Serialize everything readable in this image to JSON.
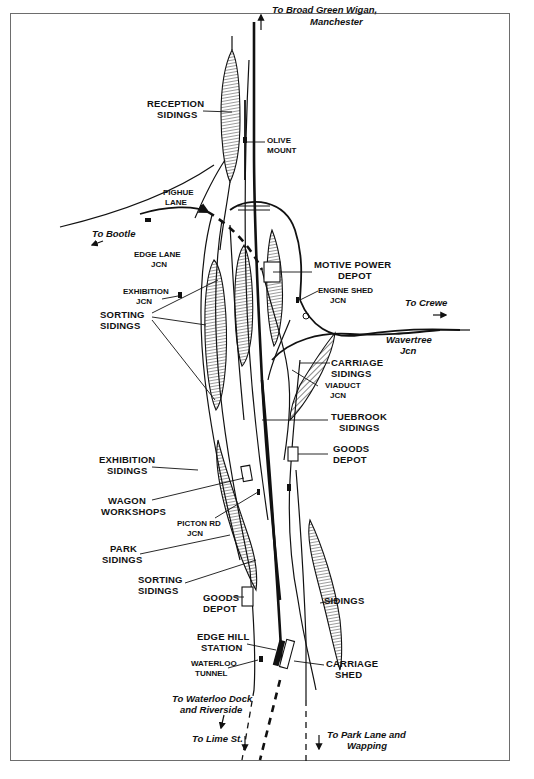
{
  "diagram": {
    "directions": {
      "north": [
        "To Broad Green Wigan,",
        "Manchester"
      ],
      "bootle": "To Bootle",
      "crewe": "To Crewe",
      "waterloo_dock": [
        "To Waterloo Dock",
        "and Riverside"
      ],
      "lime_st": "To Lime St.",
      "park_lane": [
        "To Park Lane and",
        "Wapping"
      ]
    },
    "labels": {
      "reception_sidings": [
        "RECEPTION",
        "SIDINGS"
      ],
      "olive_mount": [
        "OLIVE",
        "MOUNT"
      ],
      "pighue_lane": [
        "PIGHUE",
        "LANE"
      ],
      "edge_lane_jcn": [
        "EDGE LANE",
        "JCN"
      ],
      "exhibition_jcn": [
        "EXHIBITION",
        "JCN"
      ],
      "motive_power_depot": [
        "MOTIVE POWER",
        "DEPOT"
      ],
      "engine_shed_jcn": [
        "ENGINE SHED",
        "JCN"
      ],
      "wavertree_jcn": [
        "Wavertree",
        "Jcn"
      ],
      "sorting_sidings_upper": [
        "SORTING",
        "SIDINGS"
      ],
      "carriage_sidings": [
        "CARRIAGE",
        "SIDINGS"
      ],
      "viaduct_jcn": [
        "VIADUCT",
        "JCN"
      ],
      "tuebrook_sidings": [
        "TUEBROOK",
        "SIDINGS"
      ],
      "goods_depot_east": [
        "GOODS",
        "DEPOT"
      ],
      "exhibition_sidings": [
        "EXHIBITION",
        "SIDINGS"
      ],
      "wagon_workshops": [
        "WAGON",
        "WORKSHOPS"
      ],
      "picton_rd_jcn": [
        "PICTON RD",
        "JCN"
      ],
      "park_sidings": [
        "PARK",
        "SIDINGS"
      ],
      "sorting_sidings_lower": [
        "SORTING",
        "SIDINGS"
      ],
      "goods_depot_west": [
        "GOODS",
        "DEPOT"
      ],
      "sidings": "SIDINGS",
      "edge_hill_station": [
        "EDGE HILL",
        "STATION"
      ],
      "waterloo_tunnel": [
        "WATERLOO",
        "TUNNEL"
      ],
      "carriage_shed": [
        "CARRIAGE",
        "SHED"
      ]
    }
  }
}
